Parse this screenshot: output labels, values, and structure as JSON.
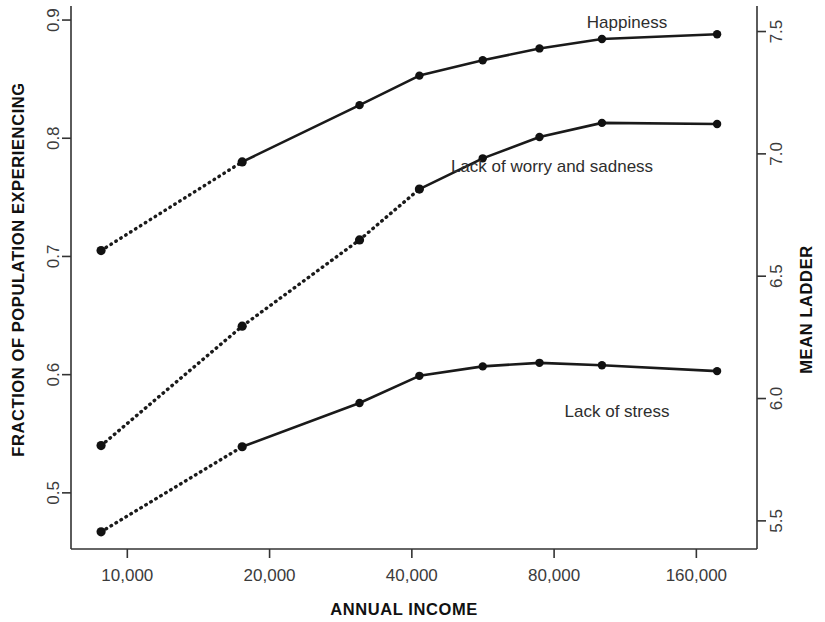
{
  "chart_data": {
    "type": "line",
    "title": "",
    "xlabel": "ANNUAL INCOME",
    "ylabel": "FRACTION OF POPULATION EXPERIENCING",
    "y2label": "MEAN LADDER",
    "x_scale": "log",
    "x_ticks": [
      10000,
      20000,
      40000,
      80000,
      160000
    ],
    "x_tick_labels": [
      "10,000",
      "20,000",
      "40,000",
      "80,000",
      "160,000"
    ],
    "xlim": [
      7600,
      215000
    ],
    "y_ticks": [
      0.5,
      0.6,
      0.7,
      0.8,
      0.9
    ],
    "y_tick_labels": [
      "0.5",
      "0.6",
      "0.7",
      "0.8",
      "0.9"
    ],
    "ylim": [
      0.4525,
      0.9085
    ],
    "y2_ticks": [
      5.5,
      6.0,
      6.5,
      7.0,
      7.5
    ],
    "y2_tick_labels": [
      "5.5",
      "6.0",
      "6.5",
      "7.0",
      "7.5"
    ],
    "y2lim": [
      5.385,
      7.588
    ],
    "grid": false,
    "legend": "inline-labels",
    "series": [
      {
        "name": "Happiness",
        "label": "Happiness",
        "axis": "right",
        "style": "dotted-then-solid",
        "solid_from_index": 1,
        "x": [
          8800,
          17500,
          31000,
          41500,
          56500,
          74500,
          101000,
          177000
        ],
        "values": [
          0.705,
          0.78,
          0.828,
          0.853,
          0.866,
          0.876,
          0.884,
          0.888
        ],
        "label_x": 627,
        "label_y": 16
      },
      {
        "name": "Lack of worry and sadness",
        "label": "Lack of worry and sadness",
        "axis": "left",
        "style": "dotted-then-solid",
        "solid_from_index": 3,
        "x": [
          8800,
          17500,
          31000,
          41500,
          56500,
          74500,
          101000,
          177000
        ],
        "values": [
          0.54,
          0.641,
          0.714,
          0.757,
          0.783,
          0.801,
          0.813,
          0.812
        ],
        "label_x": 552,
        "label_y": 160
      },
      {
        "name": "Lack of stress",
        "label": "Lack of stress",
        "axis": "left",
        "style": "dotted-then-solid",
        "solid_from_index": 1,
        "x": [
          8800,
          17500,
          31000,
          41500,
          56500,
          74500,
          101000,
          177000
        ],
        "values": [
          0.467,
          0.539,
          0.576,
          0.599,
          0.607,
          0.61,
          0.608,
          0.603
        ],
        "label_x": 617,
        "label_y": 405
      }
    ]
  }
}
